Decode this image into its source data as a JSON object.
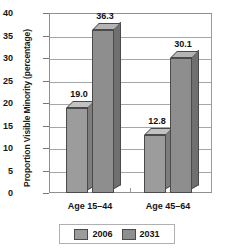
{
  "chart_data": {
    "type": "bar",
    "title": "",
    "subtitle": "",
    "xlabel": "",
    "ylabel": "Proportion Visible Minority (percentage)",
    "categories": [
      "Age 15–44",
      "Age 45–64"
    ],
    "series": [
      {
        "name": "2006",
        "values": [
          19.0,
          12.8
        ],
        "color": "#9c9c9c"
      },
      {
        "name": "2031",
        "values": [
          36.3,
          30.1
        ],
        "color": "#8e8e8e"
      }
    ],
    "data_labels": [
      "19.0",
      "36.3",
      "12.8",
      "30.1"
    ],
    "ylim": [
      0,
      40
    ],
    "yticks": [
      "0",
      "5",
      "10",
      "15",
      "20",
      "25",
      "30",
      "35",
      "40"
    ],
    "grid": true,
    "legend_position": "bottom-center"
  },
  "legend": {
    "entries": [
      {
        "label": "2006",
        "color": "#9c9c9c"
      },
      {
        "label": "2031",
        "color": "#8e8e8e"
      }
    ]
  }
}
